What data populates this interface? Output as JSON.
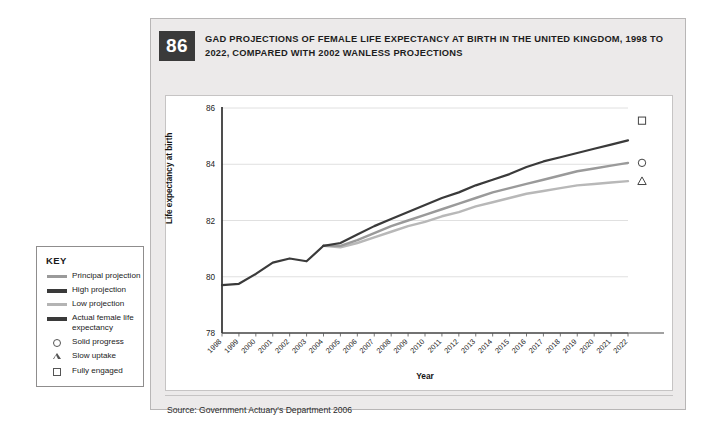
{
  "figure": {
    "number": "86",
    "title": "GAD PROJECTIONS OF FEMALE LIFE EXPECTANCY AT BIRTH IN THE UNITED KINGDOM, 1998 TO 2022, COMPARED WITH 2002 WANLESS PROJECTIONS",
    "source": "Source: Government Actuary's Department 2006"
  },
  "key": {
    "heading": "KEY",
    "lines": [
      {
        "label": "Principal projection",
        "color": "#9a9a9a",
        "weight": "thin"
      },
      {
        "label": "High projection",
        "color": "#3a3a3a",
        "weight": "thick"
      },
      {
        "label": "Low projection",
        "color": "#b4b4b4",
        "weight": "thin"
      },
      {
        "label": "Actual female life expectancy",
        "color": "#3a3a3a",
        "weight": "thick"
      }
    ],
    "markers": [
      {
        "label": "Solid progress",
        "shape": "circle"
      },
      {
        "label": "Slow uptake",
        "shape": "triangle"
      },
      {
        "label": "Fully engaged",
        "shape": "square"
      }
    ]
  },
  "chart_data": {
    "type": "line",
    "title": "GAD projections of female life expectancy at birth in the United Kingdom, 1998 to 2022, compared with 2002 Wanless projections",
    "xlabel": "Year",
    "ylabel": "Life expectancy at birth",
    "ylim": [
      78,
      86
    ],
    "yticks": [
      78,
      80,
      82,
      84,
      86
    ],
    "grid": true,
    "legend_position": "external-left",
    "x": [
      1998,
      1999,
      2000,
      2001,
      2002,
      2003,
      2004,
      2005,
      2006,
      2007,
      2008,
      2009,
      2010,
      2011,
      2012,
      2013,
      2014,
      2015,
      2016,
      2017,
      2018,
      2019,
      2020,
      2021,
      2022
    ],
    "xticklabels": [
      "1998",
      "1999",
      "2000",
      "2001",
      "2002",
      "2003",
      "2004",
      "2005",
      "2006",
      "2007",
      "2008",
      "2009",
      "2010",
      "2011",
      "2012",
      "2013",
      "2014",
      "2015",
      "2016",
      "2017",
      "2018",
      "2019",
      "2020",
      "2021",
      "2022"
    ],
    "series": [
      {
        "name": "Actual female life expectancy",
        "color": "#3a3a3a",
        "width": 2.2,
        "x": [
          1998,
          1999,
          2000,
          2001,
          2002,
          2003,
          2004
        ],
        "values": [
          79.7,
          79.75,
          80.1,
          80.5,
          80.65,
          80.55,
          81.1
        ]
      },
      {
        "name": "High projection",
        "color": "#3a3a3a",
        "width": 2.2,
        "x": [
          2004,
          2005,
          2006,
          2007,
          2008,
          2009,
          2010,
          2011,
          2012,
          2013,
          2014,
          2015,
          2016,
          2017,
          2018,
          2019,
          2020,
          2021,
          2022
        ],
        "values": [
          81.1,
          81.2,
          81.5,
          81.8,
          82.05,
          82.3,
          82.55,
          82.8,
          83.0,
          83.25,
          83.45,
          83.65,
          83.9,
          84.1,
          84.25,
          84.4,
          84.55,
          84.7,
          84.85
        ]
      },
      {
        "name": "Principal projection",
        "color": "#9a9a9a",
        "width": 2.4,
        "x": [
          2004,
          2005,
          2006,
          2007,
          2008,
          2009,
          2010,
          2011,
          2012,
          2013,
          2014,
          2015,
          2016,
          2017,
          2018,
          2019,
          2020,
          2021,
          2022
        ],
        "values": [
          81.1,
          81.1,
          81.3,
          81.55,
          81.8,
          82.0,
          82.2,
          82.4,
          82.6,
          82.8,
          83.0,
          83.15,
          83.3,
          83.45,
          83.6,
          83.75,
          83.85,
          83.95,
          84.05
        ]
      },
      {
        "name": "Low projection",
        "color": "#b8b8b8",
        "width": 2.4,
        "x": [
          2004,
          2005,
          2006,
          2007,
          2008,
          2009,
          2010,
          2011,
          2012,
          2013,
          2014,
          2015,
          2016,
          2017,
          2018,
          2019,
          2020,
          2021,
          2022
        ],
        "values": [
          81.1,
          81.05,
          81.2,
          81.4,
          81.6,
          81.8,
          81.95,
          82.15,
          82.3,
          82.5,
          82.65,
          82.8,
          82.95,
          83.05,
          83.15,
          83.25,
          83.3,
          83.35,
          83.4
        ]
      }
    ],
    "markers": [
      {
        "name": "Fully engaged",
        "shape": "square",
        "x": 2022,
        "value": 85.55
      },
      {
        "name": "Solid progress",
        "shape": "circle",
        "x": 2022,
        "value": 84.05
      },
      {
        "name": "Slow uptake",
        "shape": "triangle",
        "x": 2022,
        "value": 83.4
      }
    ]
  }
}
